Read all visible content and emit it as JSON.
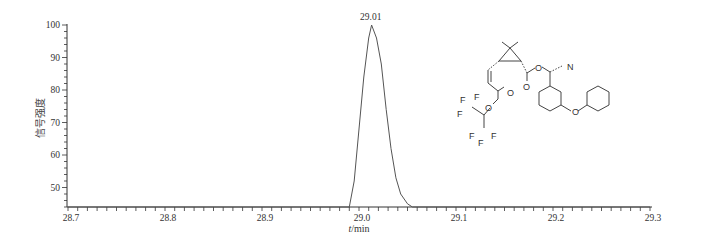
{
  "chart_data": {
    "type": "line",
    "title": "",
    "xlabel": "t/min",
    "ylabel": "信号强度",
    "xlim": [
      28.7,
      29.3
    ],
    "ylim": [
      44,
      100
    ],
    "x_ticks": [
      "28.7",
      "28.8",
      "28.9",
      "29.0",
      "29.1",
      "29.2",
      "29.3"
    ],
    "y_ticks": [
      "50",
      "60",
      "70",
      "80",
      "90",
      "100"
    ],
    "grid": false,
    "legend": null,
    "annotations": [
      {
        "text": "29.01",
        "x": 29.01,
        "y": 100
      }
    ],
    "series": [
      {
        "name": "chromatogram",
        "x": [
          28.7,
          28.99,
          28.995,
          29.0,
          29.005,
          29.01,
          29.013,
          29.018,
          29.023,
          29.028,
          29.033,
          29.038,
          29.043,
          29.05,
          29.055,
          29.3
        ],
        "y": [
          44,
          44,
          52,
          68,
          84,
          96,
          100,
          96,
          88,
          74,
          62,
          53,
          48,
          45,
          44,
          44
        ]
      }
    ],
    "inset": {
      "type": "chemical-structure",
      "labels": [
        "F",
        "F",
        "F",
        "F",
        "F",
        "F",
        "O",
        "O",
        "O",
        "O",
        "O",
        "N"
      ]
    }
  }
}
